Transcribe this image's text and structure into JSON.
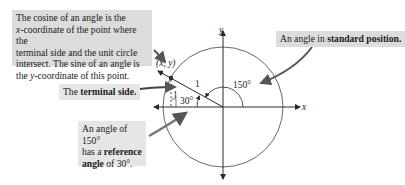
{
  "callouts": {
    "cosine_sine": {
      "line1": "The cosine of an angle is the",
      "line2_var": "x",
      "line2_rest": "-coordinate of the point where the",
      "line3": "terminal side and the unit circle",
      "line4": "intersect. The sine of an angle is",
      "line5_pre": "the ",
      "line5_var": "y",
      "line5_rest": "-coordinate of this  point."
    },
    "standard_position": {
      "prefix": "An angle in ",
      "bold": "standard position."
    },
    "terminal_side": {
      "prefix": "The ",
      "bold": "terminal side."
    },
    "reference_angle": {
      "line1": "An angle of 150°",
      "line2_pre": "has a ",
      "line2_bold": "reference",
      "line3_bold": "angle",
      "line3_rest": " of 30°."
    }
  },
  "diagram": {
    "x_axis_label": "x",
    "y_axis_label": "y",
    "point_label": "(x, y)",
    "radius_label": "1",
    "angle_label": "150°",
    "reference_angle_label": "30°",
    "right_angle_mark": "1",
    "colors": {
      "callout_bg": "#dcdcdc",
      "line": "#2a2a2a",
      "arrow": "#555555"
    }
  }
}
